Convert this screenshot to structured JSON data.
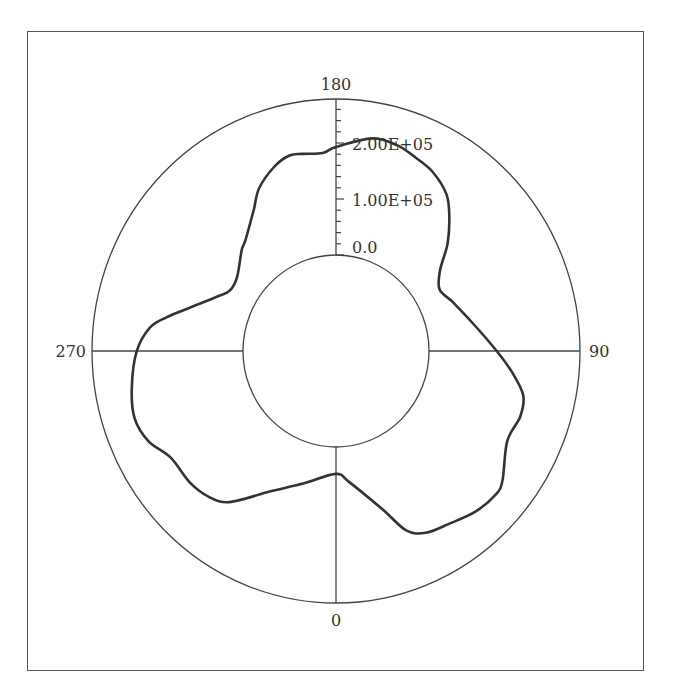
{
  "chart_data": {
    "type": "polar_line",
    "title": "",
    "angle_labels": [
      {
        "angle": 0,
        "label": "0"
      },
      {
        "angle": 90,
        "label": "90"
      },
      {
        "angle": 180,
        "label": "180"
      },
      {
        "angle": 270,
        "label": "270"
      }
    ],
    "radial_tick_labels": [
      "0.0",
      "1.00E+05",
      "2.00E+05"
    ],
    "radial_ticks": [
      0,
      100000,
      200000
    ],
    "radial_range": [
      0,
      280000
    ],
    "angle_orientation": "0 at bottom, 90 at right, 180 at top, 270 at left",
    "series": [
      {
        "name": "profile",
        "color": "#333333",
        "points": [
          {
            "theta": 0,
            "r": 48000
          },
          {
            "theta": 6,
            "r": 64000
          },
          {
            "theta": 17,
            "r": 125000
          },
          {
            "theta": 22,
            "r": 174000
          },
          {
            "theta": 27,
            "r": 193000
          },
          {
            "theta": 34,
            "r": 201000
          },
          {
            "theta": 42,
            "r": 214000
          },
          {
            "theta": 49,
            "r": 219000
          },
          {
            "theta": 53,
            "r": 213000
          },
          {
            "theta": 63,
            "r": 183000
          },
          {
            "theta": 71,
            "r": 188000
          },
          {
            "theta": 77,
            "r": 183000
          },
          {
            "theta": 83,
            "r": 157000
          },
          {
            "theta": 90,
            "r": 125000
          },
          {
            "theta": 101,
            "r": 86000
          },
          {
            "theta": 112,
            "r": 61000
          },
          {
            "theta": 120,
            "r": 49000
          },
          {
            "theta": 127,
            "r": 69000
          },
          {
            "theta": 133,
            "r": 110000
          },
          {
            "theta": 139,
            "r": 147000
          },
          {
            "theta": 144,
            "r": 175000
          },
          {
            "theta": 151,
            "r": 195000
          },
          {
            "theta": 157,
            "r": 204000
          },
          {
            "theta": 163,
            "r": 213000
          },
          {
            "theta": 170,
            "r": 214000
          },
          {
            "theta": 180,
            "r": 193000
          },
          {
            "theta": 184,
            "r": 183000
          },
          {
            "theta": 190,
            "r": 186000
          },
          {
            "theta": 194,
            "r": 188000
          },
          {
            "theta": 199,
            "r": 177000
          },
          {
            "theta": 206,
            "r": 152000
          },
          {
            "theta": 211,
            "r": 123000
          },
          {
            "theta": 220,
            "r": 88000
          },
          {
            "theta": 224,
            "r": 79000
          },
          {
            "theta": 234,
            "r": 54000
          },
          {
            "theta": 241,
            "r": 52000
          },
          {
            "theta": 246,
            "r": 68000
          },
          {
            "theta": 254,
            "r": 109000
          },
          {
            "theta": 259,
            "r": 146000
          },
          {
            "theta": 263,
            "r": 174000
          },
          {
            "theta": 270,
            "r": 196000
          },
          {
            "theta": 280,
            "r": 211000
          },
          {
            "theta": 288,
            "r": 219000
          },
          {
            "theta": 295,
            "r": 210000
          },
          {
            "theta": 302,
            "r": 188000
          },
          {
            "theta": 311,
            "r": 186000
          },
          {
            "theta": 318,
            "r": 179000
          },
          {
            "theta": 324,
            "r": 162000
          },
          {
            "theta": 334,
            "r": 108000
          },
          {
            "theta": 346,
            "r": 72000
          }
        ]
      }
    ],
    "grid": {
      "inner_circle_value": 0,
      "crosshair": true
    }
  }
}
